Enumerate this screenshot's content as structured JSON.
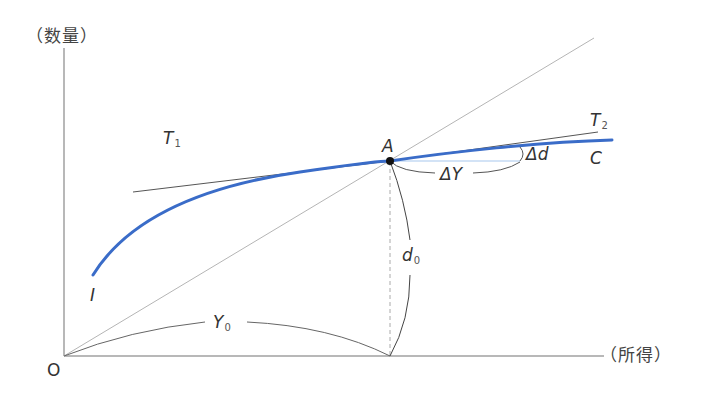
{
  "diagram": {
    "axes": {
      "y_label": "（数量）",
      "x_label": "（所得）",
      "origin_label": "O"
    },
    "curve": {
      "name": "Engel curve",
      "start_label": "I",
      "end_label": "C",
      "color": "#3a6cc8"
    },
    "point": {
      "label": "A"
    },
    "tangents": {
      "t1": {
        "letter": "T",
        "sub": "1"
      },
      "t2": {
        "letter": "T",
        "sub": "2"
      }
    },
    "annotations": {
      "delta_y": "ΔY",
      "delta_d": "Δd",
      "y0": {
        "letter": "Y",
        "sub": "0"
      },
      "d0": {
        "letter": "d",
        "sub": "0"
      }
    },
    "colors": {
      "axis": "#9a9a9a",
      "line": "#555555",
      "diagonal": "#b0b0b0",
      "curve": "#3a6cc8",
      "delta_line": "#a8c8ee"
    }
  }
}
